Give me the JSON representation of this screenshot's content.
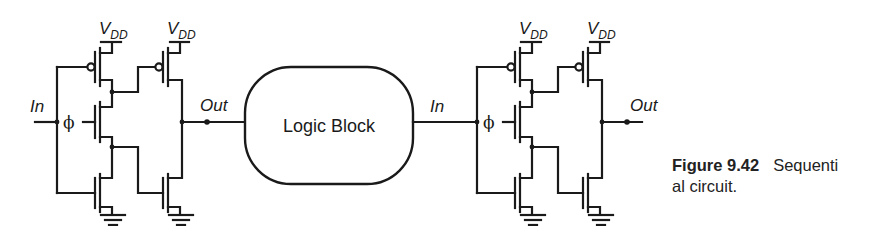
{
  "figure": {
    "stages": [
      {
        "id": "left-latch",
        "input_label": "In",
        "clock_label": "ϕ",
        "supply_label_main": "V",
        "supply_label_sub": "DD",
        "output_label": "Out"
      },
      {
        "id": "right-latch",
        "input_label": "In",
        "clock_label": "ϕ",
        "supply_label_main": "V",
        "supply_label_sub": "DD",
        "output_label": "Out"
      }
    ],
    "logic_block": {
      "label": "Logic Block"
    }
  },
  "caption": {
    "number": "Figure 9.42",
    "text_line1": "Sequenti",
    "text_line2": "al circuit."
  },
  "colors": {
    "ink": "#1a1a1a",
    "background": "#ffffff"
  }
}
